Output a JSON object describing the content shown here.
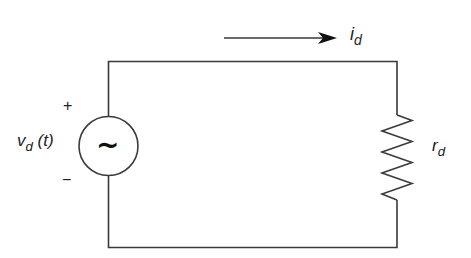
{
  "diagram": {
    "type": "circuit",
    "source": {
      "label_main": "v",
      "label_sub": "d",
      "label_arg": " (t)",
      "symbol": "~",
      "polarity_plus": "+",
      "polarity_minus": "−"
    },
    "current": {
      "label_main": "i",
      "label_sub": "d",
      "direction": "clockwise (left-to-right along top wire)"
    },
    "resistor": {
      "label_main": "r",
      "label_sub": "d"
    },
    "colors": {
      "wire": "#3a3a3a",
      "text": "#222222",
      "background": "#ffffff"
    }
  }
}
